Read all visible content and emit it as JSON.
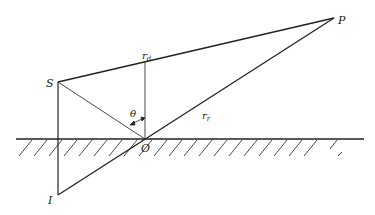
{
  "diagram": {
    "type": "geometry-reflection",
    "points": {
      "S": {
        "label": "S",
        "x": 58,
        "y": 82
      },
      "P": {
        "label": "P",
        "x": 334,
        "y": 18
      },
      "O": {
        "label": "O",
        "x": 145,
        "y": 139
      },
      "I": {
        "label": "I",
        "x": 58,
        "y": 195
      }
    },
    "labels": {
      "direct_ray": "r",
      "direct_ray_sub": "d",
      "reflected_ray": "r",
      "reflected_ray_sub": "r",
      "angle": "θ",
      "source": "S",
      "receiver": "P",
      "reflection_point": "O",
      "image_source": "I"
    },
    "colors": {
      "line": "#222222",
      "background": "#ffffff"
    }
  }
}
